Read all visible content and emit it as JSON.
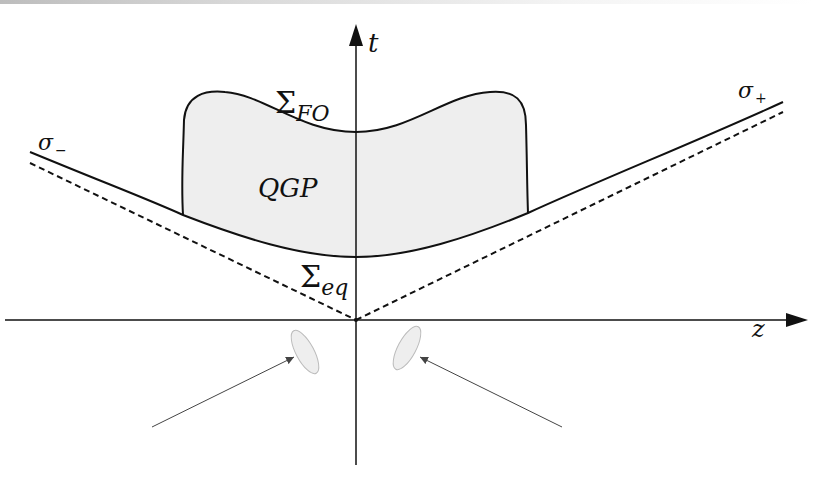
{
  "diagram": {
    "axes": {
      "t_label": "t",
      "z_label": "z"
    },
    "labels": {
      "sigma_minus": {
        "base": "σ",
        "sub": "−"
      },
      "sigma_plus": {
        "base": "σ",
        "sub": "+"
      },
      "freeze_out": {
        "base": "Σ",
        "sub": "FO"
      },
      "equilibrium": {
        "base": "Σ",
        "sub": "eq"
      },
      "qgp": "QGP"
    },
    "colors": {
      "line": "#111111",
      "qgp_fill": "#eeeeee",
      "nucleus_fill": "#eeeeee",
      "nucleus_stroke": "#bbbbbb",
      "arrow": "#444444"
    },
    "elements": [
      "t-axis (vertical arrow)",
      "z-axis (horizontal arrow)",
      "light-cone dashed lines",
      "hyperbola sigma",
      "QGP region bounded by freeze-out surface",
      "two incoming nuclei (ellipses) with arrows"
    ]
  }
}
